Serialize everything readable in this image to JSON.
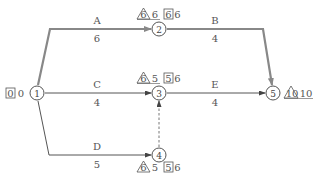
{
  "diagram": {
    "type": "activity-on-arrow network",
    "colors": {
      "critical": "#888888",
      "normal": "#555555",
      "text": "#555555",
      "background": "#ffffff"
    },
    "nodes": [
      {
        "id": "1",
        "x": 37,
        "y": 93,
        "box": [
          "0",
          "0"
        ],
        "triangle": "",
        "after": ""
      },
      {
        "id": "2",
        "x": 159,
        "y": 29,
        "triangle": "6",
        "triangle_after": "6",
        "box": [
          "6",
          "6"
        ]
      },
      {
        "id": "3",
        "x": 159,
        "y": 93,
        "triangle": "6",
        "triangle_after": "5",
        "box": [
          "5",
          "6"
        ]
      },
      {
        "id": "4",
        "x": 159,
        "y": 155,
        "triangle": "6",
        "triangle_after": "5",
        "box": [
          "5",
          "6"
        ]
      },
      {
        "id": "5",
        "x": 273,
        "y": 93,
        "triangle": "10",
        "triangle_after": "10"
      }
    ],
    "activities": [
      {
        "name": "A",
        "duration": "6",
        "from": "1",
        "to": "2",
        "critical": true
      },
      {
        "name": "B",
        "duration": "4",
        "from": "2",
        "to": "5",
        "critical": true
      },
      {
        "name": "C",
        "duration": "4",
        "from": "1",
        "to": "3",
        "critical": false
      },
      {
        "name": "D",
        "duration": "5",
        "from": "1",
        "to": "4",
        "critical": false
      },
      {
        "name": "E",
        "duration": "4",
        "from": "3",
        "to": "5",
        "critical": false
      },
      {
        "name": "dummy",
        "duration": "",
        "from": "4",
        "to": "3",
        "dashed": true
      }
    ],
    "labels": {
      "node1": {
        "id": "1",
        "box_left": "0",
        "box_right": "0"
      },
      "node2": {
        "id": "2",
        "tri": "6",
        "tri_after": "6",
        "box_left": "6",
        "box_right": "6"
      },
      "node3": {
        "id": "3",
        "tri": "6",
        "tri_after": "5",
        "box_left": "5",
        "box_right": "6"
      },
      "node4": {
        "id": "4",
        "tri": "6",
        "tri_after": "5",
        "box_left": "5",
        "box_right": "6"
      },
      "node5": {
        "id": "5",
        "tri": "10",
        "tri_after": "10"
      },
      "A": {
        "name": "A",
        "duration": "6"
      },
      "B": {
        "name": "B",
        "duration": "4"
      },
      "C": {
        "name": "C",
        "duration": "4"
      },
      "D": {
        "name": "D",
        "duration": "5"
      },
      "E": {
        "name": "E",
        "duration": "4"
      }
    }
  }
}
